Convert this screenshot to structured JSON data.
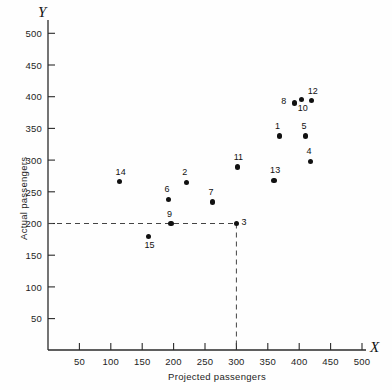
{
  "chart_data": {
    "type": "scatter",
    "title": "",
    "xlabel": "Projected passengers",
    "ylabel": "Actual passengers",
    "x_axis_symbol": "X",
    "y_axis_symbol": "Y",
    "xlim": [
      0,
      530
    ],
    "ylim": [
      0,
      520
    ],
    "xticks": [
      50,
      100,
      150,
      200,
      250,
      300,
      350,
      400,
      450,
      500
    ],
    "yticks": [
      50,
      100,
      150,
      200,
      250,
      300,
      350,
      400,
      450,
      500
    ],
    "grid": false,
    "legend": "none",
    "reference_lines": [
      {
        "type": "horizontal",
        "value": 200,
        "style": "dashed",
        "from_x": 0,
        "to_x": 300
      },
      {
        "type": "vertical",
        "value": 300,
        "style": "dashed",
        "from_y": 0,
        "to_y": 200
      }
    ],
    "points": [
      {
        "label": "1",
        "x": 368,
        "y": 338,
        "label_pos": "above"
      },
      {
        "label": "2",
        "x": 220,
        "y": 265,
        "label_pos": "above"
      },
      {
        "label": "3",
        "x": 300,
        "y": 200,
        "label_pos": "right"
      },
      {
        "label": "4",
        "x": 418,
        "y": 298,
        "label_pos": "above"
      },
      {
        "label": "5",
        "x": 410,
        "y": 338,
        "label_pos": "above"
      },
      {
        "label": "6",
        "x": 192,
        "y": 238,
        "label_pos": "above"
      },
      {
        "label": "7",
        "x": 262,
        "y": 234,
        "label_pos": "above"
      },
      {
        "label": "8",
        "x": 392,
        "y": 390,
        "label_pos": "left"
      },
      {
        "label": "9",
        "x": 196,
        "y": 200,
        "label_pos": "above"
      },
      {
        "label": "10",
        "x": 404,
        "y": 396,
        "label_pos": "below"
      },
      {
        "label": "11",
        "x": 302,
        "y": 289,
        "label_pos": "above"
      },
      {
        "label": "12",
        "x": 420,
        "y": 394,
        "label_pos": "above"
      },
      {
        "label": "13",
        "x": 360,
        "y": 268,
        "label_pos": "above"
      },
      {
        "label": "14",
        "x": 114,
        "y": 266,
        "label_pos": "above"
      },
      {
        "label": "15",
        "x": 160,
        "y": 180,
        "label_pos": "below"
      }
    ]
  }
}
